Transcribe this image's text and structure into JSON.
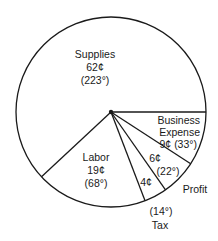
{
  "chart_data": {
    "type": "pie",
    "title": "",
    "unit": "cents",
    "total": 100,
    "start_angle_deg": 0,
    "direction": "clockwise-from-3-oclock",
    "slices": [
      {
        "name": "Business Expense",
        "value": 9,
        "value_label": "9¢",
        "degrees": 33,
        "degrees_label": "(33°)"
      },
      {
        "name": "Profit",
        "value": 6,
        "value_label": "6¢",
        "degrees": 22,
        "degrees_label": "(22°)"
      },
      {
        "name": "Tax",
        "value": 4,
        "value_label": "4¢",
        "degrees": 14,
        "degrees_label": "(14°)"
      },
      {
        "name": "Labor",
        "value": 19,
        "value_label": "19¢",
        "degrees": 68,
        "degrees_label": "(68°)"
      },
      {
        "name": "Supplies",
        "value": 62,
        "value_label": "62¢",
        "degrees": 223,
        "degrees_label": "(223°)"
      }
    ],
    "colors": {
      "stroke": "#1a1a1a",
      "fill": "#ffffff"
    }
  },
  "labels": {
    "supplies": {
      "name": "Supplies",
      "value": "62¢",
      "degrees": "(223°)"
    },
    "business": {
      "name1": "Business",
      "name2": "Expense",
      "value_deg": "9¢ (33°)"
    },
    "profit": {
      "value": "6¢",
      "degrees": "(22°)",
      "name": "Profit"
    },
    "tax": {
      "value": "4¢",
      "degrees": "(14°)",
      "name": "Tax"
    },
    "labor": {
      "name": "Labor",
      "value": "19¢",
      "degrees": "(68°)"
    }
  }
}
